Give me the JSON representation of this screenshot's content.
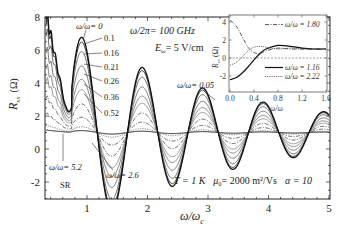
{
  "chart_data": {
    "type": "line",
    "title": "",
    "xlabel": "ω/ω_c",
    "ylabel": "R_xx (Ω)",
    "xlim": [
      0.3,
      5
    ],
    "ylim": [
      -3,
      8
    ],
    "xticks": [
      1,
      2,
      3,
      4,
      5
    ],
    "yticks": [
      8,
      6,
      4,
      2,
      0,
      -2
    ],
    "grid": false,
    "annotations": {
      "freq": "ω/2π= 100 GHz",
      "field_E": "E",
      "field_sub": "ω",
      "field_val": "= 5 V/cm",
      "params_T": "T = 1 K",
      "params_mu": "μ",
      "params_mu_sub": "0",
      "params_mu_val": "= 2000 m²/Vs",
      "params_alpha": "α = 10",
      "sr_label": "SR",
      "label_0": "ω/ω= 0",
      "label_005": "ω/ω= 0.05",
      "label_26": "ω/ω= 2.6",
      "label_52": "ω/ω= 5.2",
      "series_labels": [
        "0.1",
        "0.16",
        "0.21",
        "0.26",
        "0.36",
        "0.52"
      ]
    },
    "series": [
      {
        "name": "ω_r/ω = 0",
        "amp": 1.0,
        "style": "solid",
        "color": "#111111",
        "width": 1.3
      },
      {
        "name": "ω_r/ω = 0.05",
        "amp": 0.95,
        "style": "solid",
        "color": "#222222",
        "width": 1.0
      },
      {
        "name": "ω_r/ω = 0.1",
        "amp": 0.85,
        "style": "solid",
        "color": "#444444",
        "width": 0.8
      },
      {
        "name": "ω_r/ω = 0.16",
        "amp": 0.7,
        "style": "solid",
        "color": "#555555",
        "width": 0.8
      },
      {
        "name": "ω_r/ω = 0.21",
        "amp": 0.56,
        "style": "solid",
        "color": "#666666",
        "width": 0.8
      },
      {
        "name": "ω_r/ω = 0.26",
        "amp": 0.45,
        "style": "solid",
        "color": "#777777",
        "width": 0.8
      },
      {
        "name": "ω_r/ω = 0.36",
        "amp": 0.3,
        "style": "dashdot",
        "color": "#333333",
        "width": 0.8
      },
      {
        "name": "ω_r/ω = 0.52",
        "amp": 0.16,
        "style": "dashdot",
        "color": "#333333",
        "width": 0.8
      },
      {
        "name": "ω_r/ω = 2.6",
        "amp": 0.06,
        "style": "dotted",
        "color": "#555555",
        "width": 0.8
      },
      {
        "name": "ω_r/ω = 5.2",
        "amp": 0.02,
        "style": "solid",
        "color": "#111111",
        "width": 1.0
      }
    ],
    "key_points_curve0": {
      "x": [
        0.35,
        0.6,
        0.92,
        1.12,
        1.5,
        1.77,
        2.2,
        2.5,
        2.78,
        3.2,
        3.5,
        3.8,
        4.2,
        4.5,
        4.75,
        5.0
      ],
      "y": [
        6.0,
        3.0,
        6.8,
        -2.5,
        1.0,
        4.5,
        -1.1,
        1.0,
        2.7,
        -0.3,
        1.0,
        2.1,
        0.1,
        1.0,
        1.8,
        1.0
      ]
    },
    "inset": {
      "xlabel": "ω/ω",
      "ylabel": "R_xx (Ω)",
      "xlim": [
        0.0,
        1.6
      ],
      "ylim": [
        -2.8,
        4.8
      ],
      "xticks": [
        "0.0",
        "0.4",
        "0.8",
        "1.2",
        "1.6"
      ],
      "yticks": [
        "4",
        "2",
        "0",
        "-2"
      ],
      "legend": [
        {
          "label": "ω/ω = 1.80",
          "style": "dashdot"
        },
        {
          "label": "ω/ω = 1.16",
          "style": "solid"
        },
        {
          "label": "ω/ω = 2.22",
          "style": "dotted"
        }
      ],
      "series": [
        {
          "name": "ω/ω_c = 1.80",
          "x": [
            0.0,
            0.1,
            0.2,
            0.3,
            0.4,
            0.5,
            0.6,
            0.8,
            1.0,
            1.2,
            1.4,
            1.6
          ],
          "y": [
            4.2,
            3.6,
            2.4,
            1.2,
            0.6,
            0.5,
            0.8,
            1.1,
            1.0,
            1.0,
            1.0,
            1.0
          ]
        },
        {
          "name": "ω/ω_c = 1.16",
          "x": [
            0.0,
            0.1,
            0.2,
            0.3,
            0.4,
            0.5,
            0.6,
            0.8,
            1.0,
            1.2,
            1.4,
            1.6
          ],
          "y": [
            -2.4,
            -2.2,
            -1.7,
            -1.0,
            -0.2,
            0.5,
            1.0,
            1.4,
            1.3,
            1.1,
            1.0,
            1.0
          ]
        },
        {
          "name": "ω/ω_c = 2.22",
          "x": [
            0.0,
            0.1,
            0.2,
            0.3,
            0.4,
            0.5,
            0.6,
            0.8,
            1.0,
            1.2,
            1.4,
            1.6
          ],
          "y": [
            -0.8,
            -0.5,
            0.1,
            0.8,
            1.2,
            1.3,
            1.2,
            1.0,
            1.1,
            1.0,
            1.0,
            1.0
          ]
        }
      ]
    }
  },
  "labels": {
    "y_axis_R": "R",
    "y_axis_sub": "xx",
    "y_axis_unit": "(Ω)",
    "x_axis_w": "ω/ω",
    "x_axis_sub": "c",
    "inset_y_R": "R",
    "inset_y_sub": "xx",
    "inset_y_unit": "(Ω)",
    "inset_x": "ω/ω"
  }
}
